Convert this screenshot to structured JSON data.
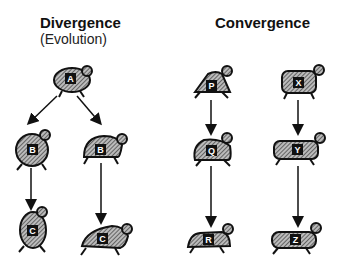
{
  "diagram": {
    "left_panel": {
      "title": "Divergence",
      "subtitle": "(Evolution)",
      "nodes": [
        {
          "id": "A",
          "label": "A"
        },
        {
          "id": "B1",
          "label": "B"
        },
        {
          "id": "B2",
          "label": "B"
        },
        {
          "id": "C1",
          "label": "C"
        },
        {
          "id": "C2",
          "label": "C"
        }
      ],
      "edges": [
        [
          "A",
          "B1"
        ],
        [
          "A",
          "B2"
        ],
        [
          "B1",
          "C1"
        ],
        [
          "B2",
          "C2"
        ]
      ]
    },
    "right_panel": {
      "title": "Convergence",
      "nodes": [
        {
          "id": "P",
          "label": "P"
        },
        {
          "id": "Q",
          "label": "Q"
        },
        {
          "id": "R",
          "label": "R"
        },
        {
          "id": "X",
          "label": "X"
        },
        {
          "id": "Y",
          "label": "Y"
        },
        {
          "id": "Z",
          "label": "Z"
        }
      ],
      "edges": [
        [
          "P",
          "Q"
        ],
        [
          "Q",
          "R"
        ],
        [
          "X",
          "Y"
        ],
        [
          "Y",
          "Z"
        ]
      ]
    }
  }
}
